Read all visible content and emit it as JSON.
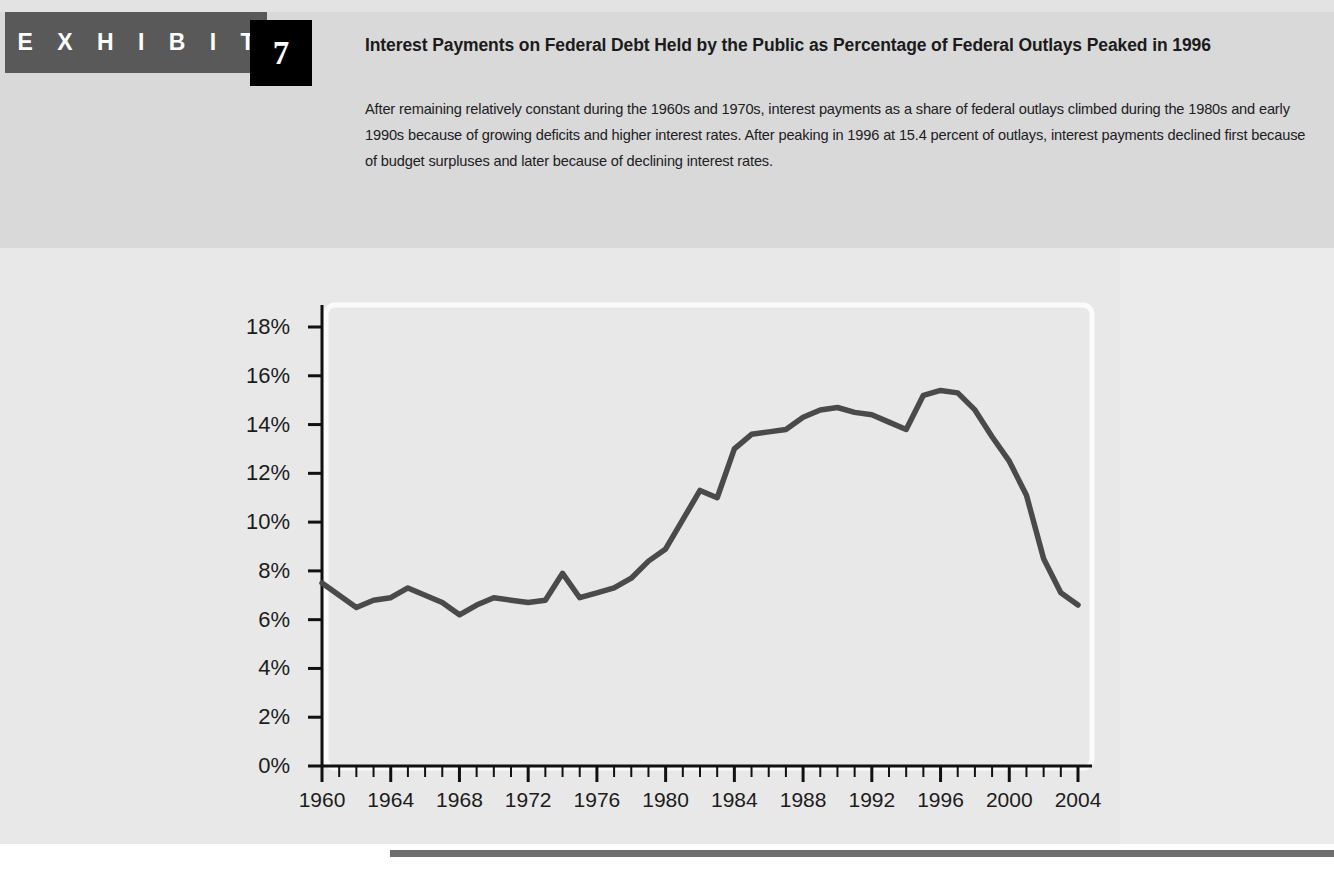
{
  "exhibit": {
    "label": "E X H I B I T",
    "number": "7"
  },
  "header": {
    "title": "Interest Payments on Federal Debt Held by the Public as Percentage of Federal Outlays Peaked in 1996",
    "description": "After remaining relatively constant during the 1960s and 1970s, interest payments as a share of federal outlays climbed during the 1980s and early 1990s because of growing deficits and higher interest rates. After peaking in 1996 at 15.4 percent of outlays, interest payments declined first because of budget surpluses and later because of declining interest rates."
  },
  "colors": {
    "banner": "#595959",
    "number_box": "#000000",
    "line": "#4a4a4a",
    "axis": "#111111",
    "page_background": "#e8e8e8",
    "header_background": "#d9d9d9",
    "bottom_rule": "#6e6e6e"
  },
  "chart_data": {
    "type": "line",
    "title": "Interest Payments on Federal Debt Held by the Public as Percentage of Federal Outlays Peaked in 1996",
    "xlabel": "",
    "ylabel": "",
    "xlim": [
      1960,
      2004
    ],
    "ylim": [
      0,
      18
    ],
    "grid": false,
    "legend": null,
    "y_ticks": [
      0,
      2,
      4,
      6,
      8,
      10,
      12,
      14,
      16,
      18
    ],
    "y_tick_labels": [
      "0%",
      "2%",
      "4%",
      "6%",
      "8%",
      "10%",
      "12%",
      "14%",
      "16%",
      "18%"
    ],
    "x_ticks": [
      1960,
      1964,
      1968,
      1972,
      1976,
      1980,
      1984,
      1988,
      1992,
      1996,
      2000,
      2004
    ],
    "x_tick_labels": [
      "1960",
      "1964",
      "1968",
      "1972",
      "1976",
      "1980",
      "1984",
      "1988",
      "1992",
      "1996",
      "2000",
      "2004"
    ],
    "x_minor_tick_interval": 1,
    "x": [
      1960,
      1961,
      1962,
      1963,
      1964,
      1965,
      1966,
      1967,
      1968,
      1969,
      1970,
      1971,
      1972,
      1973,
      1974,
      1975,
      1976,
      1977,
      1978,
      1979,
      1980,
      1981,
      1982,
      1983,
      1984,
      1985,
      1986,
      1987,
      1988,
      1989,
      1990,
      1991,
      1992,
      1993,
      1994,
      1995,
      1996,
      1997,
      1998,
      1999,
      2000,
      2001,
      2002,
      2003,
      2004
    ],
    "values": [
      7.5,
      7.0,
      6.5,
      6.8,
      6.9,
      7.3,
      7.0,
      6.7,
      6.2,
      6.6,
      6.9,
      6.8,
      6.7,
      6.8,
      7.9,
      6.9,
      7.1,
      7.3,
      7.7,
      8.4,
      8.9,
      10.1,
      11.3,
      11.0,
      13.0,
      13.6,
      13.7,
      13.8,
      14.3,
      14.6,
      14.7,
      14.5,
      14.4,
      14.1,
      13.8,
      15.2,
      15.4,
      15.3,
      14.6,
      13.5,
      12.5,
      11.1,
      8.5,
      7.1,
      6.6
    ],
    "annotations": [
      {
        "year": 1996,
        "value": 15.4,
        "note": "peak"
      }
    ]
  }
}
